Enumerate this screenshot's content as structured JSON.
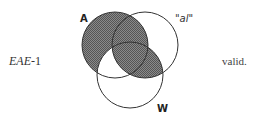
{
  "syllogism": {
    "form": "EAE",
    "figure_suffix": "-1",
    "verdict": "valid."
  },
  "venn": {
    "sets": [
      {
        "id": "A",
        "label": "A",
        "cx": 115,
        "cy": 45,
        "r": 33
      },
      {
        "id": "al",
        "label": "\"al\"",
        "cx": 145,
        "cy": 45,
        "r": 33
      },
      {
        "id": "W",
        "label": "W",
        "cx": 130,
        "cy": 75,
        "r": 33
      }
    ],
    "shaded_regions": [
      "A outside W",
      "A ∩ al",
      "al ∩ W"
    ],
    "unshaded_regions": [
      "A ∩ W outside al"
    ],
    "colors": {
      "stroke": "#333333",
      "hatch": "#555555",
      "background": "#ffffff"
    }
  }
}
